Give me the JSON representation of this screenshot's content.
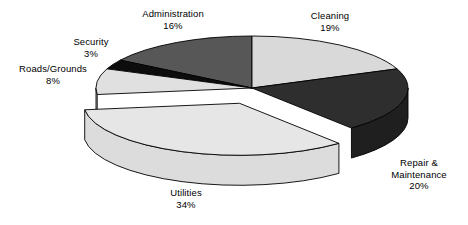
{
  "chart_data": {
    "type": "pie",
    "title": "",
    "subtitle": "",
    "style": "3d-exploded",
    "grid": false,
    "legend_position": "none",
    "labels_outside": true,
    "value_suffix": "%",
    "categories": [
      "Cleaning",
      "Repair & Maintenance",
      "Utilities",
      "Roads/Grounds",
      "Security",
      "Administration"
    ],
    "values": [
      19,
      20,
      34,
      8,
      3,
      16
    ],
    "slices": [
      {
        "name": "Cleaning",
        "label_line1": "Cleaning",
        "label_line2": "",
        "value": 19,
        "value_label": "19%",
        "color": "#d9d9d9",
        "side_color": "#b8b8b8",
        "exploded": false
      },
      {
        "name": "Repair & Maintenance",
        "label_line1": "Repair &",
        "label_line2": "Maintenance",
        "value": 20,
        "value_label": "20%",
        "color": "#2e2e2e",
        "side_color": "#1f1f1f",
        "exploded": false
      },
      {
        "name": "Utilities",
        "label_line1": "Utilities",
        "label_line2": "",
        "value": 34,
        "value_label": "34%",
        "color": "#e6e6e6",
        "side_color": "#dcdcdc",
        "exploded": true
      },
      {
        "name": "Roads/Grounds",
        "label_line1": "Roads/Grounds",
        "label_line2": "",
        "value": 8,
        "value_label": "8%",
        "color": "#e0e0e0",
        "side_color": "#c4c4c4",
        "exploded": false
      },
      {
        "name": "Security",
        "label_line1": "Security",
        "label_line2": "",
        "value": 3,
        "value_label": "3%",
        "color": "#0d0d0d",
        "side_color": "#000000",
        "exploded": false
      },
      {
        "name": "Administration",
        "label_line1": "Administration",
        "label_line2": "",
        "value": 16,
        "value_label": "16%",
        "color": "#575757",
        "side_color": "#3d3d3d",
        "exploded": false
      }
    ],
    "colors": {
      "background": "#ffffff",
      "outline": "#000000",
      "text": "#000000"
    }
  }
}
